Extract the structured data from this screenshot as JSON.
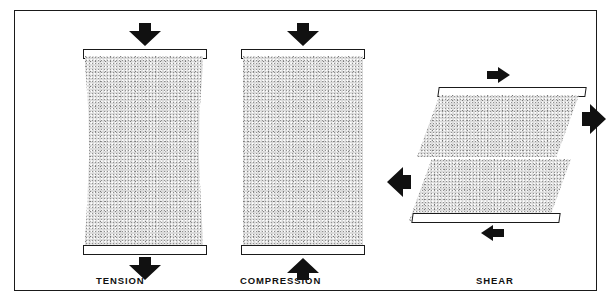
{
  "figure": {
    "frame_color": "#1a1a1a",
    "background": "#ffffff",
    "specimen_fill": "#d9d9d9",
    "arrow_color": "#111111"
  },
  "panels": [
    {
      "id": "tension",
      "label": "TENSION",
      "specimen_shape": "necked-rectangle",
      "platens": [
        "top",
        "bottom"
      ],
      "arrows": [
        {
          "name": "tension-arrow-top",
          "direction": "down",
          "size": "large"
        },
        {
          "name": "tension-arrow-bottom",
          "direction": "down",
          "size": "large"
        }
      ]
    },
    {
      "id": "compression",
      "label": "COMPRESSION",
      "specimen_shape": "rectangle",
      "platens": [
        "top",
        "bottom"
      ],
      "arrows": [
        {
          "name": "compression-arrow-top",
          "direction": "down",
          "size": "large"
        },
        {
          "name": "compression-arrow-bottom",
          "direction": "up",
          "size": "large"
        }
      ]
    },
    {
      "id": "shear",
      "label": "SHEAR",
      "specimen_shape": "parallelogram-split",
      "platens": [
        "top",
        "bottom"
      ],
      "arrows": [
        {
          "name": "shear-arrow-top",
          "direction": "right",
          "size": "small"
        },
        {
          "name": "shear-arrow-right",
          "direction": "right",
          "size": "large"
        },
        {
          "name": "shear-arrow-left",
          "direction": "left",
          "size": "large"
        },
        {
          "name": "shear-arrow-bottom",
          "direction": "left",
          "size": "small"
        }
      ]
    }
  ],
  "labels": {
    "tension": "TENSION",
    "compression": "COMPRESSION",
    "shear": "SHEAR"
  }
}
